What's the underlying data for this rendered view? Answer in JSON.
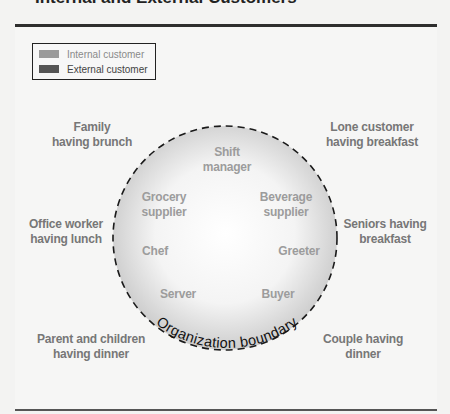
{
  "title": "Internal and External Customers",
  "legend": {
    "items": [
      {
        "label": "Internal customer",
        "color": "#9a9a9a"
      },
      {
        "label": "External customer",
        "color": "#555555"
      }
    ]
  },
  "boundary": {
    "label": "Organization boundary",
    "fill_center": "#ffffff",
    "fill_edge": "#cfcfcf",
    "stroke": "#1a1a1a"
  },
  "internal_customers": [
    {
      "line1": "Shift",
      "line2": "manager"
    },
    {
      "line1": "Grocery",
      "line2": "supplier"
    },
    {
      "line1": "Beverage",
      "line2": "supplier"
    },
    {
      "line1": "Chef",
      "line2": ""
    },
    {
      "line1": "Greeter",
      "line2": ""
    },
    {
      "line1": "Server",
      "line2": ""
    },
    {
      "line1": "Buyer",
      "line2": ""
    }
  ],
  "external_customers": [
    {
      "line1": "Family",
      "line2": "having brunch"
    },
    {
      "line1": "Lone customer",
      "line2": "having breakfast"
    },
    {
      "line1": "Office worker",
      "line2": "having lunch"
    },
    {
      "line1": "Seniors having",
      "line2": "breakfast"
    },
    {
      "line1": "Parent and children",
      "line2": "having dinner"
    },
    {
      "line1": "Couple having",
      "line2": "dinner"
    }
  ]
}
